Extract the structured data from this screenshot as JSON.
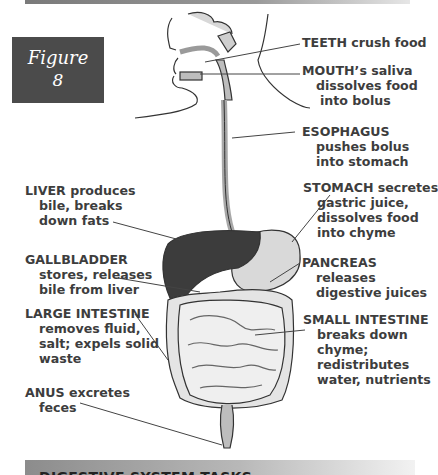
{
  "figure": {
    "word": "Figure",
    "number": "8"
  },
  "labels": {
    "teeth": {
      "head": "TEETH crush food",
      "lines": []
    },
    "mouth": {
      "head": "MOUTH’s saliva",
      "lines": [
        "dissolves food",
        "into bolus"
      ]
    },
    "esophagus": {
      "head": "ESOPHAGUS",
      "lines": [
        "pushes bolus",
        "into stomach"
      ]
    },
    "stomach": {
      "head": "STOMACH secretes",
      "lines": [
        "gastric juice,",
        "dissolves food",
        "into chyme"
      ]
    },
    "pancreas": {
      "head": "PANCREAS",
      "lines": [
        "releases",
        "digestive juices"
      ]
    },
    "small_intestine": {
      "head": "SMALL INTESTINE",
      "lines": [
        "breaks down",
        "chyme;",
        "redistributes",
        "water, nutrients"
      ]
    },
    "liver": {
      "head": "LIVER produces",
      "lines": [
        "bile, breaks",
        "down fats"
      ]
    },
    "gallbladder": {
      "head": "GALLBLADDER",
      "lines": [
        "stores, releases",
        "bile from liver"
      ]
    },
    "large_intestine": {
      "head": "LARGE INTESTINE",
      "lines": [
        "removes fluid,",
        "salt; expels solid",
        "waste"
      ]
    },
    "anus": {
      "head": "ANUS excretes",
      "lines": [
        "feces"
      ]
    }
  },
  "section_banner": {
    "title": "DIGESTIVE SYSTEM TASKS"
  },
  "colors": {
    "organ_dark": "#3c3c3c",
    "organ_light": "#d9d9d9",
    "text": "#3d3d3d",
    "figure_box": "#4b4b4b"
  }
}
